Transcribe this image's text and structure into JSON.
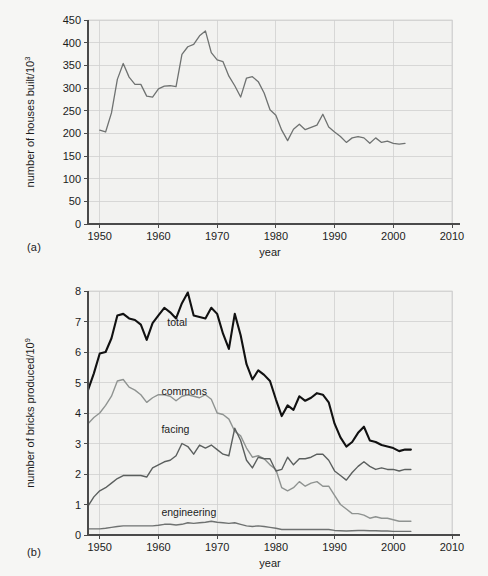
{
  "figure": {
    "panel_a_label": "(a)",
    "panel_b_label": "(b)",
    "background_color": "#f6f6f4",
    "plot_background_color": "#f2f2f0",
    "grid_color": "#cfcfcf",
    "axis_color": "#4a4a4a"
  },
  "chart_data": [
    {
      "id": "panel-a",
      "type": "line",
      "title": "",
      "panel": "(a)",
      "xlabel": "year",
      "ylabel": "number of houses built/10³",
      "ylabel_base": "number of houses built/10",
      "ylabel_exponent": "3",
      "xlim": [
        1948,
        2010
      ],
      "ylim": [
        0,
        450
      ],
      "xticks": [
        1950,
        1960,
        1970,
        1980,
        1990,
        2000,
        2010
      ],
      "xtick_labels": [
        "1950",
        "1960",
        "1970",
        "1980",
        "1990",
        "2000",
        "2010"
      ],
      "yticks": [
        0,
        50,
        100,
        150,
        200,
        250,
        300,
        350,
        400,
        450
      ],
      "ytick_labels": [
        "0",
        "50",
        "100",
        "150",
        "200",
        "250",
        "300",
        "350",
        "400",
        "450"
      ],
      "grid": true,
      "legend": "none",
      "series": [
        {
          "name": "houses built",
          "color": "#6f7271",
          "width": 1.3,
          "x": [
            1950,
            1951,
            1952,
            1953,
            1954,
            1955,
            1956,
            1957,
            1958,
            1959,
            1960,
            1961,
            1962,
            1963,
            1964,
            1965,
            1966,
            1967,
            1968,
            1969,
            1970,
            1971,
            1972,
            1973,
            1974,
            1975,
            1976,
            1977,
            1978,
            1979,
            1980,
            1981,
            1982,
            1983,
            1984,
            1985,
            1986,
            1987,
            1988,
            1989,
            1990,
            1991,
            1992,
            1993,
            1994,
            1995,
            1996,
            1997,
            1998,
            1999,
            2000,
            2001,
            2002
          ],
          "values": [
            207,
            203,
            245,
            319,
            354,
            324,
            308,
            308,
            282,
            280,
            298,
            304,
            305,
            303,
            374,
            391,
            396,
            415,
            426,
            378,
            362,
            358,
            326,
            305,
            280,
            322,
            325,
            314,
            289,
            252,
            240,
            207,
            184,
            209,
            220,
            208,
            213,
            218,
            242,
            214,
            203,
            193,
            180,
            190,
            193,
            190,
            178,
            190,
            180,
            183,
            178,
            176,
            178,
            180,
            180
          ],
          "units": "thousands of houses"
        }
      ]
    },
    {
      "id": "panel-b",
      "type": "line",
      "title": "",
      "panel": "(b)",
      "xlabel": "year",
      "ylabel": "number of bricks produced/10⁹",
      "ylabel_base": "number of bricks produced/10",
      "ylabel_exponent": "9",
      "xlim": [
        1948,
        2010
      ],
      "ylim": [
        0,
        8
      ],
      "xticks": [
        1950,
        1960,
        1970,
        1980,
        1990,
        2000,
        2010
      ],
      "xtick_labels": [
        "1950",
        "1960",
        "1970",
        "1980",
        "1990",
        "2000",
        "2010"
      ],
      "yticks": [
        0,
        1,
        2,
        3,
        4,
        5,
        6,
        7,
        8
      ],
      "ytick_labels": [
        "0",
        "1",
        "2",
        "3",
        "4",
        "5",
        "6",
        "7",
        "8"
      ],
      "grid": true,
      "legend": "inline-labels",
      "series": [
        {
          "name": "total",
          "label": "total",
          "color": "#111111",
          "width": 2.1,
          "label_x": 1961.5,
          "label_y": 6.85,
          "x": [
            1948,
            1949,
            1950,
            1951,
            1952,
            1953,
            1954,
            1955,
            1956,
            1957,
            1958,
            1959,
            1960,
            1961,
            1962,
            1963,
            1964,
            1965,
            1966,
            1967,
            1968,
            1969,
            1970,
            1971,
            1972,
            1973,
            1974,
            1975,
            1976,
            1977,
            1978,
            1979,
            1980,
            1981,
            1982,
            1983,
            1984,
            1985,
            1986,
            1987,
            1988,
            1989,
            1990,
            1991,
            1992,
            1993,
            1994,
            1995,
            1996,
            1997,
            1998,
            1999,
            2000,
            2001,
            2002,
            2003
          ],
          "values": [
            4.75,
            5.3,
            5.95,
            6.0,
            6.45,
            7.2,
            7.25,
            7.1,
            7.05,
            6.9,
            6.4,
            6.95,
            7.2,
            7.45,
            7.3,
            7.1,
            7.6,
            7.95,
            7.2,
            7.15,
            7.1,
            7.45,
            7.25,
            6.6,
            6.1,
            7.25,
            6.55,
            5.6,
            5.1,
            5.4,
            5.25,
            5.05,
            4.45,
            3.9,
            4.25,
            4.1,
            4.55,
            4.4,
            4.5,
            4.65,
            4.6,
            4.35,
            3.65,
            3.2,
            2.9,
            3.05,
            3.35,
            3.55,
            3.1,
            3.05,
            2.95,
            2.9,
            2.85,
            2.75,
            2.8,
            2.8
          ]
        },
        {
          "name": "commons",
          "label": "commons",
          "color": "#8f9391",
          "width": 1.4,
          "label_x": 1960.5,
          "label_y": 4.6,
          "x": [
            1948,
            1949,
            1950,
            1951,
            1952,
            1953,
            1954,
            1955,
            1956,
            1957,
            1958,
            1959,
            1960,
            1961,
            1962,
            1963,
            1964,
            1965,
            1966,
            1967,
            1968,
            1969,
            1970,
            1971,
            1972,
            1973,
            1974,
            1975,
            1976,
            1977,
            1978,
            1979,
            1980,
            1981,
            1982,
            1983,
            1984,
            1985,
            1986,
            1987,
            1988,
            1989,
            1990,
            1991,
            1992,
            1993,
            1994,
            1995,
            1996,
            1997,
            1998,
            1999,
            2000,
            2001,
            2002,
            2003
          ],
          "values": [
            3.65,
            3.85,
            4.0,
            4.25,
            4.55,
            5.05,
            5.1,
            4.85,
            4.75,
            4.6,
            4.35,
            4.5,
            4.6,
            4.6,
            4.55,
            4.4,
            4.55,
            4.6,
            4.55,
            4.5,
            4.6,
            4.45,
            4.0,
            3.95,
            3.8,
            3.4,
            3.25,
            2.85,
            2.55,
            2.6,
            2.5,
            2.3,
            2.15,
            1.55,
            1.45,
            1.55,
            1.75,
            1.6,
            1.7,
            1.75,
            1.6,
            1.6,
            1.3,
            1.0,
            0.85,
            0.7,
            0.7,
            0.65,
            0.55,
            0.6,
            0.55,
            0.55,
            0.5,
            0.45,
            0.45,
            0.45
          ]
        },
        {
          "name": "facing",
          "label": "facing",
          "color": "#5b5f5e",
          "width": 1.4,
          "label_x": 1960.5,
          "label_y": 3.35,
          "x": [
            1948,
            1949,
            1950,
            1951,
            1952,
            1953,
            1954,
            1955,
            1956,
            1957,
            1958,
            1959,
            1960,
            1961,
            1962,
            1963,
            1964,
            1965,
            1966,
            1967,
            1968,
            1969,
            1970,
            1971,
            1972,
            1973,
            1974,
            1975,
            1976,
            1977,
            1978,
            1979,
            1980,
            1981,
            1982,
            1983,
            1984,
            1985,
            1986,
            1987,
            1988,
            1989,
            1990,
            1991,
            1992,
            1993,
            1994,
            1995,
            1996,
            1997,
            1998,
            1999,
            2000,
            2001,
            2002,
            2003
          ],
          "values": [
            0.95,
            1.25,
            1.45,
            1.55,
            1.7,
            1.85,
            1.95,
            1.95,
            1.95,
            1.95,
            1.9,
            2.2,
            2.3,
            2.4,
            2.45,
            2.6,
            3.0,
            2.9,
            2.65,
            2.95,
            2.85,
            2.95,
            2.8,
            2.65,
            2.6,
            3.5,
            3.1,
            2.45,
            2.2,
            2.55,
            2.5,
            2.5,
            2.1,
            2.15,
            2.55,
            2.3,
            2.5,
            2.5,
            2.55,
            2.65,
            2.65,
            2.45,
            2.1,
            1.95,
            1.8,
            2.05,
            2.25,
            2.4,
            2.25,
            2.15,
            2.2,
            2.15,
            2.15,
            2.1,
            2.15,
            2.15
          ]
        },
        {
          "name": "engineering",
          "label": "engineering",
          "color": "#6f7271",
          "width": 1.4,
          "label_x": 1960.5,
          "label_y": 0.62,
          "x": [
            1948,
            1949,
            1950,
            1951,
            1952,
            1953,
            1954,
            1955,
            1956,
            1957,
            1958,
            1959,
            1960,
            1961,
            1962,
            1963,
            1964,
            1965,
            1966,
            1967,
            1968,
            1969,
            1970,
            1971,
            1972,
            1973,
            1974,
            1975,
            1976,
            1977,
            1978,
            1979,
            1980,
            1981,
            1982,
            1983,
            1984,
            1985,
            1986,
            1987,
            1988,
            1989,
            1990,
            1991,
            1992,
            1993,
            1994,
            1995,
            1996,
            1997,
            1998,
            1999,
            2000,
            2001,
            2002,
            2003
          ],
          "values": [
            0.2,
            0.2,
            0.2,
            0.22,
            0.25,
            0.28,
            0.3,
            0.3,
            0.3,
            0.3,
            0.3,
            0.3,
            0.32,
            0.35,
            0.35,
            0.33,
            0.35,
            0.4,
            0.38,
            0.4,
            0.42,
            0.45,
            0.42,
            0.4,
            0.38,
            0.4,
            0.35,
            0.3,
            0.28,
            0.3,
            0.28,
            0.25,
            0.22,
            0.18,
            0.18,
            0.18,
            0.18,
            0.18,
            0.18,
            0.18,
            0.18,
            0.18,
            0.15,
            0.14,
            0.13,
            0.14,
            0.15,
            0.15,
            0.14,
            0.14,
            0.13,
            0.13,
            0.12,
            0.12,
            0.12,
            0.12
          ]
        }
      ]
    }
  ]
}
